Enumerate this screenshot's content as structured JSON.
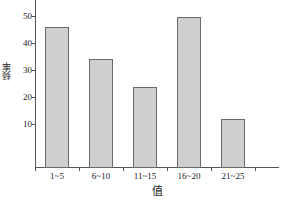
{
  "chart_data": {
    "type": "bar",
    "title": "",
    "subtitle": "",
    "xlabel": "值",
    "ylabel": "频率",
    "categories": [
      "1~5",
      "6~10",
      "11~15",
      "16~20",
      "21~25"
    ],
    "values": [
      47,
      36.5,
      27,
      50.5,
      16.5
    ],
    "series": [
      {
        "name": "频率",
        "values": [
          47,
          36.5,
          27,
          50.5,
          16.5
        ]
      }
    ],
    "ylim": [
      0,
      56
    ],
    "xlim": [
      0,
      5
    ],
    "ytick_labels": [
      "10",
      "20",
      "30",
      "40",
      "50"
    ],
    "ytick_values": [
      10,
      20,
      30,
      40,
      50
    ],
    "grid": false,
    "legend": false,
    "legend_position": "none",
    "annotations": [],
    "colors": {
      "bar_fill": "#cfcfcf",
      "bar_edge": "#6b6b6b",
      "axis": "#555555",
      "text": "#1a1a1a",
      "background": "#ffffff"
    }
  }
}
